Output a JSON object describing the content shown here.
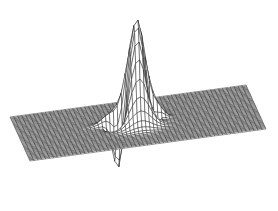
{
  "chart_data": {
    "type": "surface",
    "title": "",
    "xlabel": "",
    "ylabel": "",
    "zlabel": "",
    "grid": false,
    "legend": null,
    "render_style": "wireframe-mesh",
    "colors": {
      "background": "#ffffff",
      "mesh": "#1a1a1a",
      "mesh_light": "#3a3a3a"
    },
    "surface": {
      "grid_x": 60,
      "grid_y": 40,
      "components": [
        {
          "kind": "gaussian",
          "cx": 0.0,
          "cy": 0.0,
          "amp": 1.0,
          "sx": 0.09,
          "sy": 0.16
        },
        {
          "kind": "gaussian",
          "cx": -0.16,
          "cy": 0.05,
          "amp": -0.55,
          "sx": 0.05,
          "sy": 0.08
        },
        {
          "kind": "gaussian",
          "cx": 0.1,
          "cy": 0.05,
          "amp": -0.45,
          "sx": 0.05,
          "sy": 0.08
        },
        {
          "kind": "gaussian",
          "cx": -0.2,
          "cy": -0.1,
          "amp": 0.12,
          "sx": 0.08,
          "sy": 0.06
        },
        {
          "kind": "gaussian",
          "cx": 0.15,
          "cy": -0.05,
          "amp": 0.08,
          "sx": 0.06,
          "sy": 0.05
        }
      ],
      "projection": {
        "origin": [
          138,
          123
        ],
        "x_axis": [
          118,
          -16
        ],
        "y_axis": [
          10,
          22
        ],
        "z_scale": 108
      }
    }
  }
}
